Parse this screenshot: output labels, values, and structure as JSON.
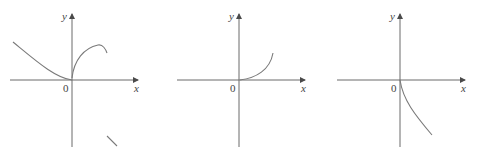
{
  "graphs": [
    {
      "id": "graph-1",
      "x_label": "x",
      "y_label": "y",
      "origin_label": "0",
      "description": "Decreasing curve from upper-left to origin, concave-up arc rising from origin then bending down, and a short decreasing segment in lower right"
    },
    {
      "id": "graph-2",
      "x_label": "x",
      "y_label": "y",
      "origin_label": "0",
      "description": "Curve starting at origin increasing and concave up to the right"
    },
    {
      "id": "graph-3",
      "x_label": "x",
      "y_label": "y",
      "origin_label": "0",
      "description": "Curve starting at origin decreasing steeply then leveling, going down to the right"
    }
  ],
  "colors": {
    "axis": "#6b6b6b",
    "curve": "#7a7a7a",
    "text": "#444444",
    "background": "#ffffff"
  }
}
